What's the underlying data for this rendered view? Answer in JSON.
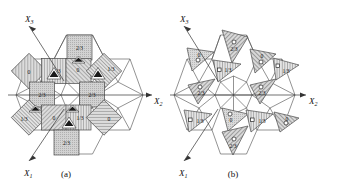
{
  "figure": {
    "type": "crystal-structure-projection-diagram",
    "panels": [
      {
        "id": "a",
        "caption": "(a)",
        "axes": [
          {
            "name": "X_3",
            "label": "X",
            "sub": "3",
            "direction": "up-left"
          },
          {
            "name": "X_2",
            "label": "X",
            "sub": "2",
            "direction": "right"
          },
          {
            "name": "X_1",
            "label": "X",
            "sub": "1",
            "direction": "down-left"
          }
        ],
        "motif": "squares-and-triangles",
        "marker": "filled-triangle",
        "height_labels": [
          "0",
          "1/3",
          "2/3"
        ],
        "tiles": [
          {
            "shape": "square",
            "label": "2/3",
            "fill": "dots",
            "cx": 97,
            "cy": 48
          },
          {
            "shape": "square",
            "label": "0",
            "fill": "hatch45",
            "cx": 29,
            "cy": 71
          },
          {
            "shape": "square",
            "label": "1/3",
            "fill": "vlines",
            "cx": 54,
            "cy": 71
          },
          {
            "shape": "square",
            "label": "0",
            "fill": "hatch45",
            "cx": 78,
            "cy": 71
          },
          {
            "shape": "square",
            "label": "1/3",
            "fill": "vlines",
            "cx": 104,
            "cy": 71
          },
          {
            "shape": "square",
            "label": "2/3",
            "fill": "dots",
            "cx": 41,
            "cy": 94
          },
          {
            "shape": "square",
            "label": "2/3",
            "fill": "dots",
            "cx": 92,
            "cy": 94
          },
          {
            "shape": "square",
            "label": "1/3",
            "fill": "vlines",
            "cx": 29,
            "cy": 117
          },
          {
            "shape": "square",
            "label": "0",
            "fill": "hatch45",
            "cx": 54,
            "cy": 117
          },
          {
            "shape": "square",
            "label": "1/3",
            "fill": "vlines",
            "cx": 78,
            "cy": 117
          },
          {
            "shape": "square",
            "label": "0",
            "fill": "hatch45",
            "cx": 104,
            "cy": 117
          },
          {
            "shape": "square",
            "label": "2/3",
            "fill": "dots",
            "cx": 66,
            "cy": 140
          }
        ]
      },
      {
        "id": "b",
        "caption": "(b)",
        "axes": [
          {
            "name": "X_3",
            "label": "X",
            "sub": "3",
            "direction": "up-left"
          },
          {
            "name": "X_2",
            "label": "X",
            "sub": "2",
            "direction": "right"
          },
          {
            "name": "X_1",
            "label": "X",
            "sub": "1",
            "direction": "down-left"
          }
        ],
        "motif": "triangles",
        "markers": [
          "open-circle",
          "open-square"
        ],
        "height_labels": [
          "0",
          "1/3",
          "2/3"
        ],
        "tiles": [
          {
            "shape": "triangle",
            "label": "2/3",
            "fill": "hatch45",
            "marker": "circle",
            "cx": 233,
            "cy": 44
          },
          {
            "shape": "triangle",
            "label": "0",
            "fill": "dots",
            "marker": "circle",
            "cx": 202,
            "cy": 57
          },
          {
            "shape": "triangle",
            "label": "0",
            "fill": "hatch45",
            "marker": "circle",
            "cx": 264,
            "cy": 59
          },
          {
            "shape": "triangle",
            "label": "1/3",
            "fill": "vlines",
            "marker": "square",
            "cx": 230,
            "cy": 70
          },
          {
            "shape": "triangle",
            "label": "1/3",
            "fill": "vlines",
            "marker": "square",
            "cx": 289,
            "cy": 71
          },
          {
            "shape": "triangle",
            "label": "2/3",
            "fill": "hatch45",
            "marker": "circle",
            "cx": 204,
            "cy": 97
          },
          {
            "shape": "triangle",
            "label": "2/3",
            "fill": "hatch45",
            "marker": "circle",
            "cx": 263,
            "cy": 97
          },
          {
            "shape": "triangle",
            "label": "1/3",
            "fill": "vlines",
            "marker": "square",
            "cx": 202,
            "cy": 124
          },
          {
            "shape": "triangle",
            "label": "0",
            "fill": "dots",
            "marker": "circle",
            "cx": 233,
            "cy": 122
          },
          {
            "shape": "triangle",
            "label": "1/3",
            "fill": "vlines",
            "marker": "square",
            "cx": 262,
            "cy": 124
          },
          {
            "shape": "triangle",
            "label": "0",
            "fill": "hatch45",
            "marker": "circle",
            "cx": 290,
            "cy": 122
          },
          {
            "shape": "triangle",
            "label": "2/3",
            "fill": "hatch45",
            "marker": "circle",
            "cx": 233,
            "cy": 148
          }
        ]
      }
    ],
    "colors": {
      "background": "#ffffff",
      "line": "#4a4a4a",
      "axis": "#333333",
      "text": "#111111",
      "tile_fill": "#d7d7d7",
      "marker_dark": "#1a1a1a"
    }
  }
}
